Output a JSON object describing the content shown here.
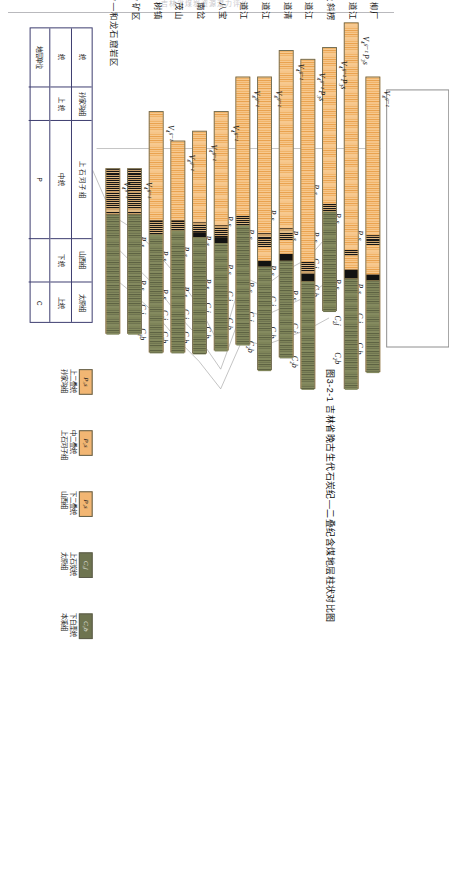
{
  "page": {
    "running_head": "吉林省煤炭资源潜力评价",
    "caption": "图3-2-1  吉林省晚古生代石炭纪—二叠纪含煤地层柱状对比图"
  },
  "units": {
    "P3s": "P₃s",
    "P2s": "P₂s",
    "C2j": "C₂j",
    "C2b": "C₂b"
  },
  "sections": [
    {
      "name": "柳厂",
      "volcanic": "V₄ᵍ⁻ᶻ",
      "bar_start": 55,
      "bar_len": 300,
      "labels": [
        "P₃s",
        "P₂s",
        "C₂j",
        "C₂b"
      ],
      "segments": [
        {
          "kind": "orange",
          "start": 0,
          "len": 160
        },
        {
          "kind": "coal",
          "start": 160,
          "len": 10
        },
        {
          "kind": "orange",
          "start": 170,
          "len": 30
        },
        {
          "kind": "black",
          "start": 200,
          "len": 6
        },
        {
          "kind": "green",
          "start": 206,
          "len": 94
        }
      ]
    },
    {
      "name": "四道江",
      "volcanic": "V₄ᵍ⁻ᶻ P₃s",
      "bar_start": 0,
      "bar_len": 372,
      "labels": [
        "P₃s",
        "P₂s",
        "C₂j",
        "C₂b"
      ],
      "segments": [
        {
          "kind": "orange",
          "start": 0,
          "len": 230
        },
        {
          "kind": "coal",
          "start": 230,
          "len": 6
        },
        {
          "kind": "orange",
          "start": 236,
          "len": 14
        },
        {
          "kind": "black",
          "start": 250,
          "len": 9
        },
        {
          "kind": "green",
          "start": 259,
          "len": 113
        }
      ]
    },
    {
      "name": "头道沟及斜楞",
      "volcanic": "V₄ᵍ⁻ᶻ P₃s",
      "bar_start": 25,
      "bar_len": 268,
      "labels": [
        "P₃s",
        "P₂s",
        "C₂j",
        "C₂b"
      ],
      "segments": [
        {
          "kind": "orange",
          "start": 0,
          "len": 158
        },
        {
          "kind": "coal",
          "start": 158,
          "len": 8
        },
        {
          "kind": "green",
          "start": 166,
          "len": 102
        }
      ]
    },
    {
      "name": "五道江",
      "volcanic": "V₄ᵍ⁻ᶻ P₃s",
      "bar_start": 37,
      "bar_len": 335,
      "labels": [
        "P₃s",
        "P₂s",
        "C₂j",
        "C₂b"
      ],
      "segments": [
        {
          "kind": "orange",
          "start": 0,
          "len": 205
        },
        {
          "kind": "coal",
          "start": 205,
          "len": 12
        },
        {
          "kind": "black",
          "start": 217,
          "len": 8
        },
        {
          "kind": "green",
          "start": 225,
          "len": 110
        }
      ]
    },
    {
      "name": "道清",
      "volcanic": "V₄ᵍ⁻ᶻ",
      "bar_start": 28,
      "bar_len": 312,
      "labels": [
        "P₃s",
        "P₂s",
        "C₂j",
        "C₂b"
      ],
      "segments": [
        {
          "kind": "orange",
          "start": 0,
          "len": 180
        },
        {
          "kind": "coal",
          "start": 180,
          "len": 12
        },
        {
          "kind": "orange",
          "start": 192,
          "len": 14
        },
        {
          "kind": "black",
          "start": 206,
          "len": 7
        },
        {
          "kind": "green",
          "start": 213,
          "len": 99
        }
      ]
    },
    {
      "name": "六道江",
      "volcanic": "V₄ᵍ⁻ᶻ",
      "bar_start": 55,
      "bar_len": 298,
      "labels": [
        "P₃s",
        "P₂s",
        "C₂j",
        "C₂b"
      ],
      "segments": [
        {
          "kind": "orange",
          "start": 0,
          "len": 158
        },
        {
          "kind": "coal",
          "start": 158,
          "len": 14
        },
        {
          "kind": "orange",
          "start": 172,
          "len": 14
        },
        {
          "kind": "black",
          "start": 186,
          "len": 6
        },
        {
          "kind": "green",
          "start": 192,
          "len": 106
        }
      ]
    },
    {
      "name": "八道江",
      "volcanic": "V₄ᵍ⁻ᶻ",
      "bar_start": 55,
      "bar_len": 272,
      "labels": [
        "P₃s",
        "P₂s",
        "C₂j",
        "C₂b"
      ],
      "segments": [
        {
          "kind": "orange",
          "start": 0,
          "len": 140
        },
        {
          "kind": "coal",
          "start": 140,
          "len": 10
        },
        {
          "kind": "green",
          "start": 150,
          "len": 122
        }
      ]
    },
    {
      "name": "八宝",
      "volcanic": "V₄ᵍ⁻ᶻ",
      "bar_start": 90,
      "bar_len": 243,
      "labels": [
        "P₃s",
        "P₂s",
        "C₂j",
        "C₂b"
      ],
      "segments": [
        {
          "kind": "orange",
          "start": 0,
          "len": 115
        },
        {
          "kind": "coal",
          "start": 115,
          "len": 12
        },
        {
          "kind": "black",
          "start": 127,
          "len": 6
        },
        {
          "kind": "green",
          "start": 133,
          "len": 110
        }
      ]
    },
    {
      "name": "南岔",
      "volcanic": "V₄ᵍ⁻ᶻ",
      "bar_start": 110,
      "bar_len": 226,
      "labels": [
        "P₃s",
        "P₂s",
        "C₂j",
        "C₂b"
      ],
      "segments": [
        {
          "kind": "orange",
          "start": 0,
          "len": 92
        },
        {
          "kind": "coal",
          "start": 92,
          "len": 10
        },
        {
          "kind": "black",
          "start": 102,
          "len": 5
        },
        {
          "kind": "green",
          "start": 107,
          "len": 119
        }
      ]
    },
    {
      "name": "南茂山",
      "volcanic": "V₄ᵍ⁻ᶻ",
      "bar_start": 120,
      "bar_len": 215,
      "labels": [
        "P₃s",
        "P₂s",
        "C₂j",
        "C₂b"
      ],
      "segments": [
        {
          "kind": "orange",
          "start": 0,
          "len": 80
        },
        {
          "kind": "coal",
          "start": 80,
          "len": 10
        },
        {
          "kind": "green",
          "start": 90,
          "len": 125
        }
      ]
    },
    {
      "name": "松树镇",
      "volcanic": "V₄ᵍ⁻ᶻ",
      "bar_start": 90,
      "bar_len": 245,
      "labels": [
        "P₃s",
        "P₂s",
        "C₂j",
        "C₂b"
      ],
      "segments": [
        {
          "kind": "orange",
          "start": 0,
          "len": 110
        },
        {
          "kind": "coal",
          "start": 110,
          "len": 14
        },
        {
          "kind": "green",
          "start": 124,
          "len": 121
        }
      ]
    },
    {
      "name": "十八道岭矿区",
      "volcanic": "V₄ᵍ⁻ᶻ",
      "bar_start": 148,
      "bar_len": 168,
      "labels": [],
      "segments": [
        {
          "kind": "coal",
          "start": 0,
          "len": 46
        },
        {
          "kind": "green",
          "start": 46,
          "len": 122
        }
      ]
    },
    {
      "name": "十八道岭—和龙石窟岩区",
      "volcanic": "V₄ᵍ⁻ᶻ",
      "bar_start": 148,
      "bar_len": 168,
      "labels": [],
      "segments": [
        {
          "kind": "coal",
          "start": 0,
          "len": 46
        },
        {
          "kind": "green",
          "start": 46,
          "len": 122
        }
      ]
    }
  ],
  "key_table": {
    "rows": [
      {
        "cells": [
          {
            "text": "统",
            "w": 60
          },
          {
            "text": "孙家沟组",
            "w": 34
          },
          {
            "text": "上 石 河 子 组",
            "w": 120
          },
          {
            "text": "山西组",
            "w": 44
          },
          {
            "text": "太原组",
            "w": 42
          }
        ]
      },
      {
        "cells": [
          {
            "text": "统",
            "w": 60
          },
          {
            "text": "上  统",
            "w": 34
          },
          {
            "text": "中   统",
            "w": 120
          },
          {
            "text": "下 统",
            "w": 44
          },
          {
            "text": "上统",
            "w": 42
          }
        ]
      },
      {
        "cells": [
          {
            "text": "地层单位",
            "w": 60
          },
          {
            "text": "",
            "w": 34
          },
          {
            "text": "P",
            "w": 120
          },
          {
            "text": "",
            "w": 44
          },
          {
            "text": "C",
            "w": 42
          }
        ]
      }
    ]
  },
  "legend": [
    {
      "code": "P₃s",
      "swatch": "orange",
      "line1": "上二叠统",
      "line2": "孙家沟组"
    },
    {
      "code": "P₂s",
      "swatch": "orange",
      "line1": "中二叠统",
      "line2": "上石河子组"
    },
    {
      "code": "P₁s",
      "swatch": "orange",
      "line1": "下二叠统",
      "line2": "山西组"
    },
    {
      "code": "C₂j",
      "swatch": "green",
      "line1": "上石炭统",
      "line2": "太原组"
    },
    {
      "code": "C₂b",
      "swatch": "green",
      "line1": "下白垩统",
      "line2": "本溪组"
    }
  ],
  "colors": {
    "orange": "#f2b673",
    "green": "#6e7450",
    "coal": "#171717",
    "frame": "#8d8d8d",
    "table_border": "#3b3b6e"
  }
}
